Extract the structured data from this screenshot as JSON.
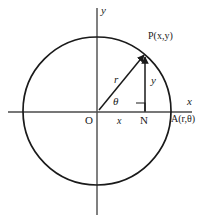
{
  "figure": {
    "type": "geometry-diagram",
    "colors": {
      "stroke": "#1a1a1a",
      "axis": "#4a4a4a",
      "background": "#ffffff",
      "text": "#1a1a1a"
    },
    "geometry": {
      "origin": {
        "x": 97,
        "y": 112
      },
      "circle": {
        "cx": 97,
        "cy": 111,
        "r": 74
      },
      "point_p": {
        "x": 145,
        "y": 54
      },
      "point_n": {
        "x": 145,
        "y": 112
      },
      "point_a": {
        "x": 171,
        "y": 112
      },
      "x_axis": {
        "x1": 8,
        "y1": 112,
        "x2": 192,
        "y2": 112
      },
      "y_axis": {
        "x1": 97,
        "y1": 8,
        "x2": 97,
        "y2": 215
      },
      "angle_theta_deg": 50,
      "right_angle_marker": {
        "x": 136,
        "y": 103,
        "size": 9
      }
    },
    "labels": {
      "y_axis": "y",
      "x_axis": "x",
      "point_p": "P(x,y)",
      "point_a": "A(r,θ)",
      "origin": "O",
      "foot_n": "N",
      "radius": "r",
      "vertical_leg": "y",
      "horizontal_leg": "x",
      "angle": "θ"
    }
  }
}
